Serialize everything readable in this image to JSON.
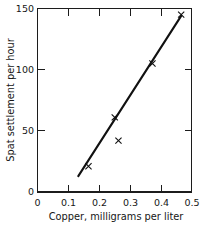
{
  "chart_data": {
    "type": "scatter",
    "title": "",
    "xlabel": "Copper, milligrams per liter",
    "ylabel": "Spat settlement per hour",
    "xlim": [
      0,
      0.5
    ],
    "ylim": [
      0,
      150
    ],
    "xticks": [
      0,
      0.1,
      0.2,
      0.3,
      0.4,
      0.5
    ],
    "xtick_labels": [
      "0",
      "0.1",
      "0.2",
      "0.3",
      "0.4",
      "0.5"
    ],
    "yticks": [
      0,
      50,
      100,
      150
    ],
    "ytick_labels": [
      "0",
      "50",
      "100",
      "150"
    ],
    "grid": false,
    "legend": false,
    "marker": "x",
    "points": [
      {
        "x": 0.165,
        "y": 21
      },
      {
        "x": 0.25,
        "y": 61
      },
      {
        "x": 0.262,
        "y": 42
      },
      {
        "x": 0.372,
        "y": 105
      },
      {
        "x": 0.465,
        "y": 145
      }
    ],
    "series": [
      {
        "name": "Spat settlement",
        "x": [
          0.165,
          0.25,
          0.262,
          0.372,
          0.465
        ],
        "values": [
          21,
          61,
          42,
          105,
          145
        ]
      }
    ],
    "fit_line": {
      "type": "line",
      "x": [
        0.132,
        0.465
      ],
      "values": [
        13,
        144
      ]
    }
  }
}
